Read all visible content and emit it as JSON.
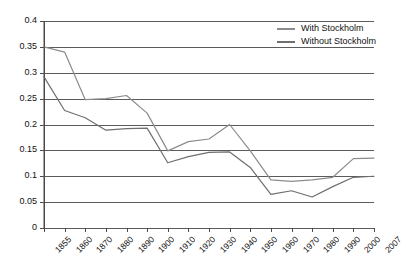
{
  "chart_data": {
    "type": "line",
    "title": "",
    "subtitle": "",
    "xlabel": "",
    "ylabel": "",
    "grid": true,
    "legend_position": "top-right",
    "categories": [
      "1855",
      "1860",
      "1870",
      "1880",
      "1890",
      "1900",
      "1910",
      "1920",
      "1930",
      "1940",
      "1950",
      "1960",
      "1970",
      "1980",
      "1990",
      "2000",
      "2007"
    ],
    "x": [
      1855,
      1860,
      1870,
      1880,
      1890,
      1900,
      1910,
      1920,
      1930,
      1940,
      1950,
      1960,
      1970,
      1980,
      1990,
      2000,
      2007
    ],
    "xlim": [
      1855,
      2007
    ],
    "ylim": [
      0,
      0.4
    ],
    "yticks": [
      "0",
      "0.05",
      "0.1",
      "0.15",
      "0.2",
      "0.25",
      "0.3",
      "0.35",
      "0.4"
    ],
    "ytick_values": [
      0,
      0.05,
      0.1,
      0.15,
      0.2,
      0.25,
      0.3,
      0.35,
      0.4
    ],
    "series": [
      {
        "name": "With Stockholm",
        "color": "#8c8c8c",
        "values": [
          0.35,
          0.34,
          0.248,
          0.25,
          0.256,
          0.222,
          0.149,
          0.167,
          0.172,
          0.2,
          0.149,
          0.093,
          0.09,
          0.093,
          0.098,
          0.134,
          0.135
        ]
      },
      {
        "name": "Without Stockholm",
        "color": "#6f6f6f",
        "values": [
          0.292,
          0.227,
          0.213,
          0.189,
          0.192,
          0.193,
          0.126,
          0.138,
          0.146,
          0.147,
          0.117,
          0.065,
          0.072,
          0.06,
          0.08,
          0.098,
          0.1
        ]
      }
    ]
  },
  "legend": {
    "items": [
      {
        "label": "With Stockholm",
        "color": "#8c8c8c"
      },
      {
        "label": "Without Stockholm",
        "color": "#6f6f6f"
      }
    ]
  },
  "axis": {
    "y_labels": [
      "0.4",
      "0.35",
      "0.3",
      "0.25",
      "0.2",
      "0.15",
      "0.1",
      "0.05",
      "0"
    ],
    "x_labels": [
      "1855",
      "1860",
      "1870",
      "1880",
      "1890",
      "1900",
      "1910",
      "1920",
      "1930",
      "1940",
      "1950",
      "1960",
      "1970",
      "1980",
      "1990",
      "2000",
      "2007"
    ]
  },
  "colors": {
    "axis": "#4a4a4a",
    "grid": "#5b5b5b",
    "series_with": "#8c8c8c",
    "series_without": "#6f6f6f",
    "background": "#ffffff"
  }
}
